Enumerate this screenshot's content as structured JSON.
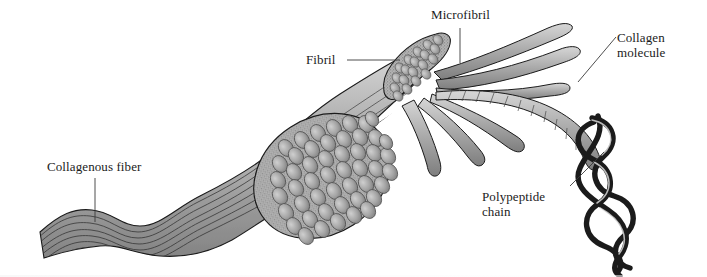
{
  "figure": {
    "background_color": "#ffffff",
    "ink_color": "#1b1b1b",
    "fiber_fill": "#9a9a9a",
    "fiber_fill_light": "#c9c9c9",
    "fiber_fill_dark": "#6e6e6e",
    "stipple_color": "#8d8d8d",
    "leader_color": "#3a3a3a"
  },
  "labels": {
    "collagenous_fiber": "Collagenous fiber",
    "fibril": "Fibril",
    "microfibril": "Microfibril",
    "collagen_molecule": "Collagen\nmolecule",
    "polypeptide_chain": "Polypeptide\nchain"
  },
  "structure_levels": [
    {
      "name": "collagenous-fiber",
      "label": "Collagenous fiber",
      "description": "wavy banded gray ribbon at left"
    },
    {
      "name": "fibril",
      "label": "Fibril",
      "description": "bundle of fibrils with stippled cut ends"
    },
    {
      "name": "microfibril",
      "label": "Microfibril",
      "description": "small bundle of microfibril strands splaying out"
    },
    {
      "name": "collagen-molecule",
      "label": "Collagen molecule",
      "description": "twisted rope-like cord"
    },
    {
      "name": "polypeptide-chain",
      "label": "Polypeptide chain",
      "description": "three intertwined strands forming a triple helix"
    }
  ]
}
